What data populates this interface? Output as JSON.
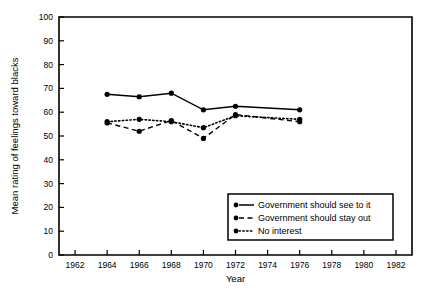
{
  "chart_data": {
    "type": "line",
    "title": "",
    "xlabel": "Year",
    "ylabel": "Mean rating of feelings toward blacks",
    "xlim": [
      1961,
      1983
    ],
    "ylim": [
      0,
      100
    ],
    "grid": false,
    "legend_position": "bottom-right",
    "x_ticks": [
      1962,
      1964,
      1966,
      1968,
      1970,
      1972,
      1974,
      1976,
      1978,
      1980,
      1982
    ],
    "x_ticklabels": [
      "1962",
      "1964",
      "1966",
      "1968",
      "1970",
      "1972",
      "1974",
      "1976",
      "1978",
      "1980",
      "1982"
    ],
    "y_ticks": [
      0,
      10,
      20,
      30,
      40,
      50,
      60,
      70,
      80,
      90,
      100
    ],
    "y_ticklabels": [
      "0",
      "10",
      "20",
      "30",
      "40",
      "50",
      "60",
      "70",
      "80",
      "90",
      "100"
    ],
    "x": [
      1964,
      1966,
      1968,
      1970,
      1972,
      1976
    ],
    "series": [
      {
        "name": "Government should see to it",
        "style": "solid",
        "marker": "filled-circle",
        "values": [
          67.5,
          66.5,
          68.0,
          61.0,
          62.5,
          61.0
        ]
      },
      {
        "name": "Government should stay out",
        "style": "dashed",
        "marker": "filled-circle",
        "values": [
          55.5,
          52.0,
          56.5,
          49.0,
          59.0,
          56.0
        ]
      },
      {
        "name": "No interest",
        "style": "dotted",
        "marker": "filled-circle",
        "values": [
          56.0,
          57.0,
          56.0,
          53.5,
          58.5,
          57.0
        ]
      }
    ]
  },
  "legend": {
    "entries": [
      {
        "label": "Government should see to it"
      },
      {
        "label": "Government should stay out"
      },
      {
        "label": "No  interest"
      }
    ]
  },
  "axes": {
    "x_title": "Year",
    "y_title": "Mean rating of feelings toward blacks"
  }
}
